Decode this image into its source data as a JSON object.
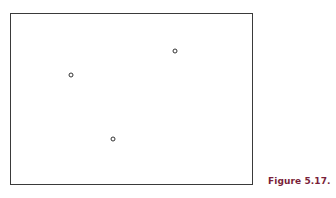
{
  "figure": {
    "caption": "Figure 5.17.",
    "caption_color": "#7a1f3a",
    "frame_color": "#3a3a3a",
    "points": [
      {
        "id": "point-1",
        "x": 71,
        "y": 75
      },
      {
        "id": "point-2",
        "x": 175,
        "y": 51
      },
      {
        "id": "point-3",
        "x": 113,
        "y": 139
      }
    ]
  }
}
